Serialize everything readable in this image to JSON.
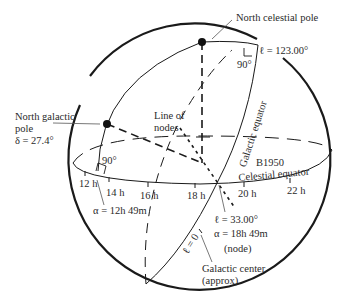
{
  "diagram": {
    "labels": {
      "north_celestial_pole": "North celestial pole",
      "l_123": "ℓ = 123.00°",
      "right_angle_top": "90°",
      "north_galactic_pole_1": "North galactic",
      "north_galactic_pole_2": "pole",
      "delta": "δ = 27.4°",
      "line_of_nodes_1": "Line of",
      "line_of_nodes_2": "nodes",
      "galactic_equator": "Galactic equator",
      "b1950": "B1950",
      "celestial_equator": "Celestial equator",
      "right_angle_left": "90°",
      "alpha_12h49m": "α = 12h 49m",
      "l_33": "ℓ = 33.00°",
      "alpha_18h49m": "α = 18h  49m",
      "node": "(node)",
      "l_0": "ℓ = 0",
      "galactic_center_1": "Galactic center",
      "galactic_center_2": "(approx)"
    },
    "hour_ticks": [
      {
        "label": "12 h"
      },
      {
        "label": "14 h"
      },
      {
        "label": "16 h"
      },
      {
        "label": "18 h"
      },
      {
        "label": "20 h"
      },
      {
        "label": "22 h"
      }
    ],
    "colors": {
      "line": "#1a1a1a",
      "text": "#2a2a2a",
      "background": "#ffffff"
    }
  }
}
